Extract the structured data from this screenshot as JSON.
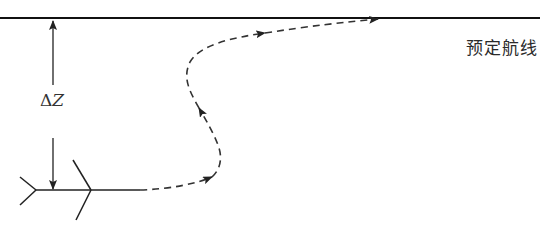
{
  "diagram": {
    "type": "aircraft-track-correction",
    "planned_route_label": "预定航线",
    "offset_label": "ΔZ",
    "offset_symbol": "Δ",
    "offset_variable": "Z",
    "colors": {
      "line": "#111111",
      "dashed_path": "#333333",
      "text": "#2a2a2a"
    },
    "elements": [
      {
        "id": "planned-route",
        "kind": "solid-line",
        "from": [
          0,
          18
        ],
        "to": [
          540,
          18
        ]
      },
      {
        "id": "offset-arrow-up",
        "kind": "arrow",
        "from": [
          53,
          85
        ],
        "to": [
          53,
          20
        ]
      },
      {
        "id": "offset-arrow-down",
        "kind": "arrow",
        "from": [
          53,
          138
        ],
        "to": [
          53,
          190
        ]
      },
      {
        "id": "aircraft",
        "kind": "aircraft-symbol",
        "nose": [
          140,
          190
        ]
      },
      {
        "id": "flight-path",
        "kind": "dashed-curve-with-arrows"
      }
    ]
  }
}
